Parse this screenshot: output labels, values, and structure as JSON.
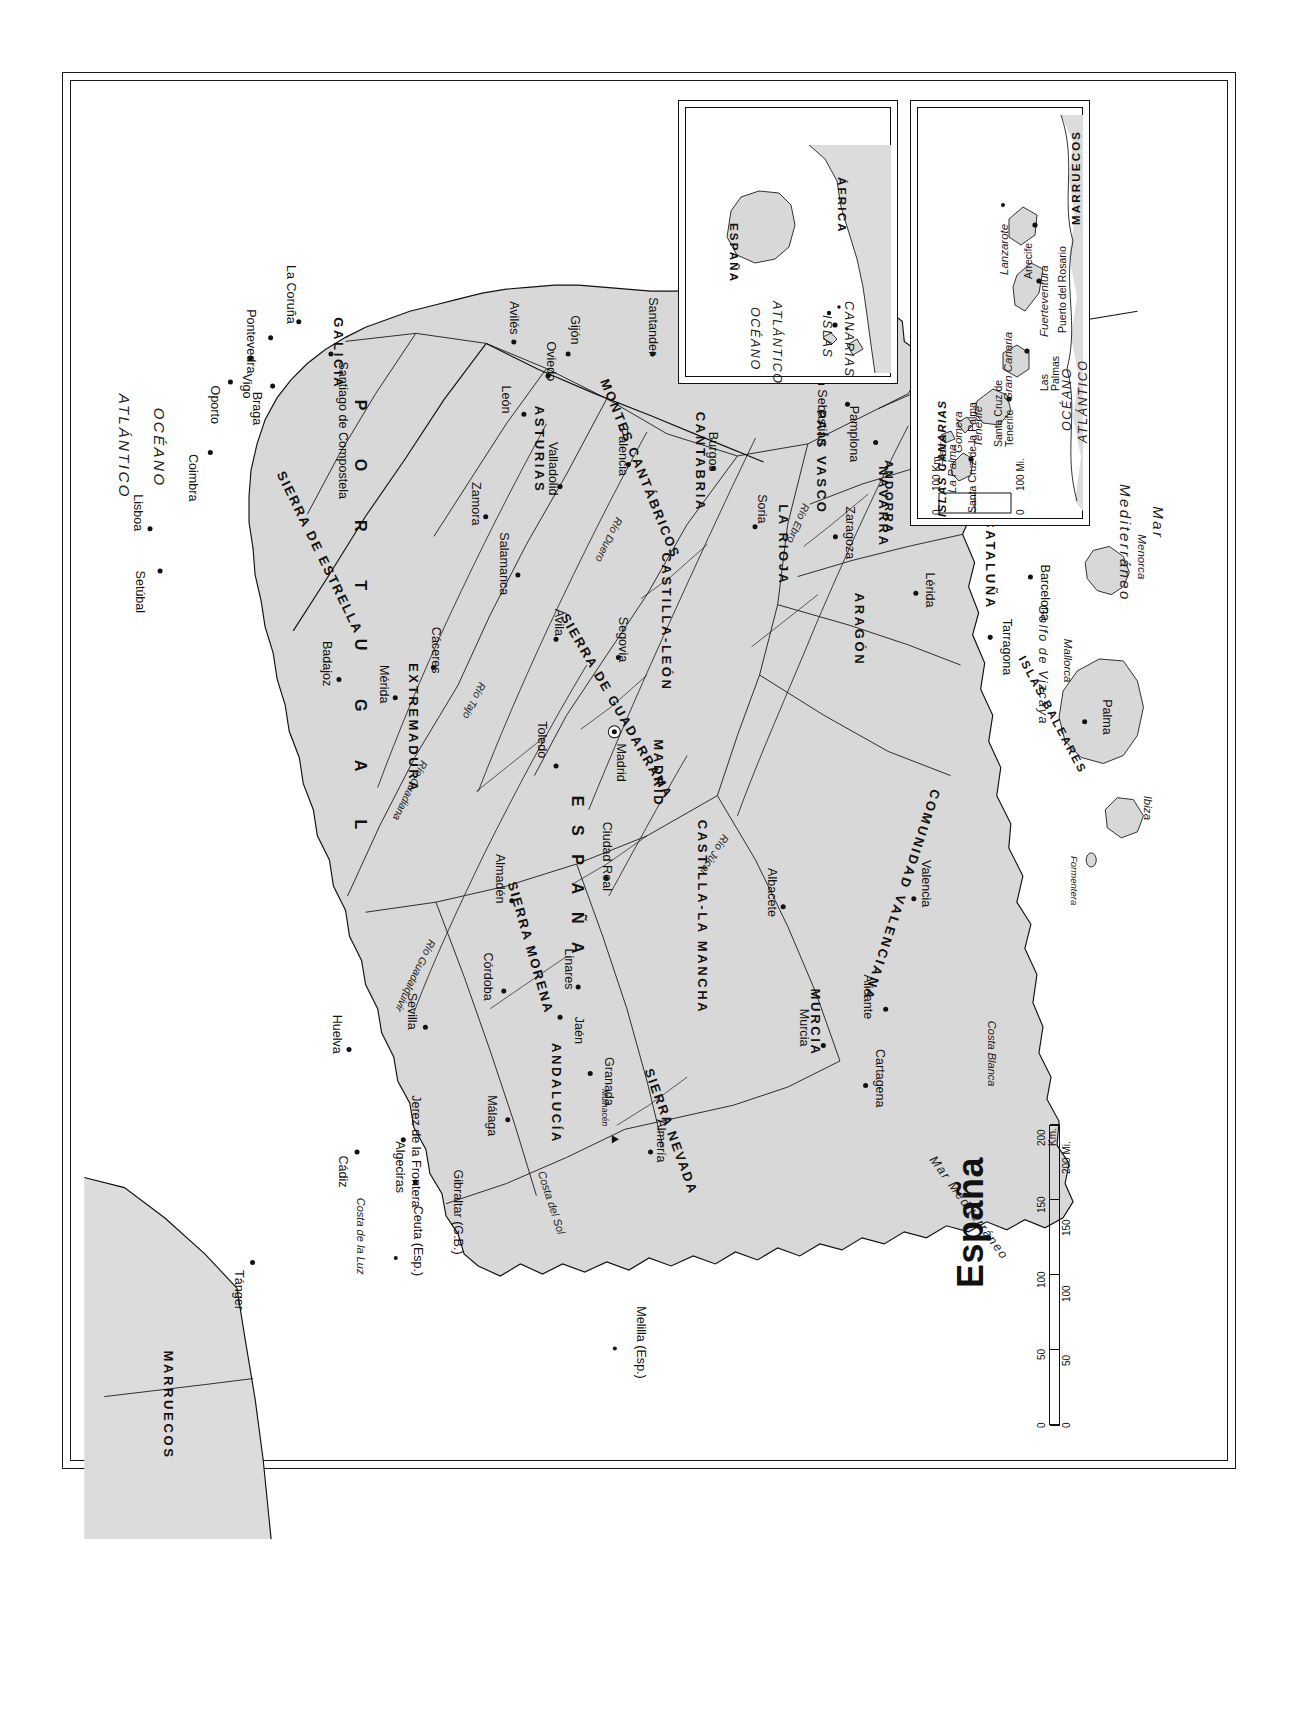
{
  "map": {
    "title": "España",
    "projection_note": "",
    "land_color": "#d8d8d8",
    "line_color": "#111111",
    "background_color": "#ffffff"
  },
  "seas": [
    {
      "name": "OCÉANO",
      "id": "oceano-atlantico-1"
    },
    {
      "name": "ATLÁNTICO",
      "id": "oceano-atlantico-2"
    },
    {
      "name": "Mar Cantábrico",
      "id": "mar-cantabrico"
    },
    {
      "name": "Golfo de Vizcaya",
      "id": "golfo-de-vizcaya"
    },
    {
      "name": "Mar",
      "id": "mar-mediterraneo-1"
    },
    {
      "name": "Mediterráneo",
      "id": "mar-mediterraneo-2"
    },
    {
      "name": "Mar Mediterráneo",
      "id": "mar-mediterraneo-3"
    }
  ],
  "countries": [
    {
      "name": "E S P A Ñ A",
      "id": "espana"
    },
    {
      "name": "P O R T U G A L",
      "id": "portugal"
    },
    {
      "name": "F R A N C I A",
      "id": "francia"
    },
    {
      "name": "MARRUECOS",
      "id": "marruecos"
    },
    {
      "name": "ANDORRA",
      "id": "andorra"
    }
  ],
  "regions": [
    {
      "name": "GALICIA"
    },
    {
      "name": "ASTURIAS"
    },
    {
      "name": "CANTABRIA"
    },
    {
      "name": "PAÍS VASCO"
    },
    {
      "name": "NAVARRA"
    },
    {
      "name": "LA RIOJA"
    },
    {
      "name": "ARAGÓN"
    },
    {
      "name": "CATALUÑA"
    },
    {
      "name": "CASTILLA-LEÓN"
    },
    {
      "name": "MADRID"
    },
    {
      "name": "EXTREMADURA"
    },
    {
      "name": "CASTILLA-LA MANCHA"
    },
    {
      "name": "COMUNIDAD VALENCIANA"
    },
    {
      "name": "MURCIA"
    },
    {
      "name": "ANDALUCÍA"
    }
  ],
  "mountains": [
    {
      "name": "MONTES PIRINEOS"
    },
    {
      "name": "MONTES CANTÁBRICOS"
    },
    {
      "name": "SIERRA DE GUADARRAMA"
    },
    {
      "name": "SIERRA MORENA"
    },
    {
      "name": "SIERRA NEVADA"
    },
    {
      "name": "SIERRA DE ESTRELLA"
    },
    {
      "name": "Mulhacén"
    }
  ],
  "rivers": [
    {
      "name": "Río Ebro"
    },
    {
      "name": "Río Duero"
    },
    {
      "name": "Río Tajo"
    },
    {
      "name": "Río Guadiana"
    },
    {
      "name": "Río Guadalquivir"
    },
    {
      "name": "Río Júcar"
    }
  ],
  "coasts": [
    {
      "name": "Costa Brava"
    },
    {
      "name": "Costa Blanca"
    },
    {
      "name": "Costa del Sol"
    },
    {
      "name": "Costa de la Luz"
    }
  ],
  "cities": [
    {
      "name": "Madrid",
      "capital": true
    },
    {
      "name": "Barcelona"
    },
    {
      "name": "Tarragona"
    },
    {
      "name": "Lérida"
    },
    {
      "name": "Zaragoza"
    },
    {
      "name": "Pamplona"
    },
    {
      "name": "San Sebastián"
    },
    {
      "name": "Bilbao"
    },
    {
      "name": "Santander"
    },
    {
      "name": "Soria"
    },
    {
      "name": "Burgos"
    },
    {
      "name": "Palencia"
    },
    {
      "name": "Valladolid"
    },
    {
      "name": "León"
    },
    {
      "name": "Oviedo"
    },
    {
      "name": "Gijón"
    },
    {
      "name": "Avilés"
    },
    {
      "name": "La Coruña"
    },
    {
      "name": "Santiago de Compostela"
    },
    {
      "name": "Pontevedra"
    },
    {
      "name": "Vigo"
    },
    {
      "name": "Zamora"
    },
    {
      "name": "Salamanca"
    },
    {
      "name": "Ávila"
    },
    {
      "name": "Segovia"
    },
    {
      "name": "Toledo"
    },
    {
      "name": "Cáceres"
    },
    {
      "name": "Mérida"
    },
    {
      "name": "Badajoz"
    },
    {
      "name": "Ciudad Real"
    },
    {
      "name": "Almadén"
    },
    {
      "name": "Córdoba"
    },
    {
      "name": "Linares"
    },
    {
      "name": "Jaén"
    },
    {
      "name": "Granada"
    },
    {
      "name": "Almería"
    },
    {
      "name": "Málaga"
    },
    {
      "name": "Sevilla"
    },
    {
      "name": "Huelva"
    },
    {
      "name": "Jerez de la Frontera"
    },
    {
      "name": "Cádiz"
    },
    {
      "name": "Algeciras"
    },
    {
      "name": "Murcia"
    },
    {
      "name": "Cartagena"
    },
    {
      "name": "Alicante"
    },
    {
      "name": "Albacete"
    },
    {
      "name": "Valencia"
    },
    {
      "name": "Palma"
    },
    {
      "name": "Braga"
    },
    {
      "name": "Oporto"
    },
    {
      "name": "Coimbra"
    },
    {
      "name": "Lisboa"
    },
    {
      "name": "Setúbal"
    },
    {
      "name": "Tánger"
    }
  ],
  "territories": [
    {
      "name": "Gibraltar (G.B.)"
    },
    {
      "name": "Ceuta (Esp.)"
    },
    {
      "name": "Melilla (Esp.)"
    }
  ],
  "balearic": {
    "group_label": "ISLAS BALEARES",
    "islands": [
      "Menorca",
      "Mallorca",
      "Ibiza",
      "Formentera"
    ],
    "city": "Palma"
  },
  "scale_main": {
    "km_labels": [
      "0",
      "50",
      "100",
      "150",
      "200"
    ],
    "km_unit": "200 Km.",
    "mi_labels": [
      "0",
      "50",
      "100",
      "150",
      "200"
    ],
    "mi_unit": "200 Mi."
  },
  "inset_locator": {
    "labels": [
      "ESPAÑA",
      "ÁFRICA",
      "OCÉANO",
      "ATLÁNTICO",
      "ISLAS",
      "CANARIAS"
    ]
  },
  "inset_canarias": {
    "title": "ISLAS CANARIAS",
    "ocean": [
      "OCÉANO",
      "ATLÁNTICO"
    ],
    "country": "MARRUECOS",
    "islands": [
      "La Palma",
      "Tenerife",
      "Gomera",
      "Hierro",
      "Gran Canaria",
      "Fuerteventura",
      "Lanzarote"
    ],
    "cities": [
      "Santa Cruz de la Palma",
      "Santa Cruz de Tenerife",
      "Las Palmas",
      "Puerto del Rosario",
      "Arrecife"
    ],
    "scale": {
      "km_labels": [
        "0",
        "100"
      ],
      "km_unit": "100 Km.",
      "mi_labels": [
        "0",
        "100"
      ],
      "mi_unit": "100 Mi."
    }
  }
}
